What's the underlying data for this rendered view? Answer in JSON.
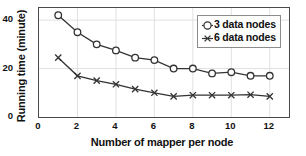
{
  "chart_data": {
    "type": "line",
    "title": "",
    "xlabel": "Number of mapper per node",
    "ylabel": "Running time (minute)",
    "x": [
      1,
      2,
      3,
      4,
      5,
      6,
      7,
      8,
      9,
      10,
      11,
      12
    ],
    "xlim": [
      0,
      13
    ],
    "ylim": [
      0,
      45
    ],
    "xticks": [
      "0",
      "2",
      "4",
      "6",
      "8",
      "10",
      "12"
    ],
    "xtick_values": [
      0,
      2,
      4,
      6,
      8,
      10,
      12
    ],
    "yticks": [
      "0",
      "20",
      "40"
    ],
    "ytick_values": [
      0,
      20,
      40
    ],
    "grid": true,
    "grid_color": "#d9d9d9",
    "legend_position": "upper right",
    "series": [
      {
        "name": "3 data nodes",
        "marker": "circle",
        "color": "#333333",
        "values": [
          42,
          35,
          30,
          27.5,
          24.5,
          23.5,
          20,
          20,
          18,
          18.5,
          17,
          17
        ]
      },
      {
        "name": "6 data nodes",
        "marker": "x",
        "color": "#333333",
        "values": [
          24.5,
          17,
          15,
          13.5,
          11.5,
          10,
          8.5,
          9,
          9,
          9,
          9.2,
          8.5
        ]
      }
    ]
  },
  "legend": {
    "entries": [
      {
        "label": "3 data nodes",
        "marker": "circle-marker"
      },
      {
        "label": "6 data nodes",
        "marker": "x-marker"
      }
    ]
  }
}
